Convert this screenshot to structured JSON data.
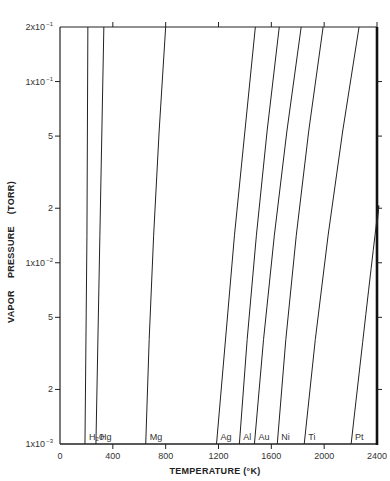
{
  "chart_data": {
    "type": "line",
    "title": "",
    "xlabel": "TEMPERATURE (°K)",
    "ylabel_parts": [
      "VAPOR",
      "PRESSURE",
      "(TORR)"
    ],
    "xlim": [
      0,
      2400
    ],
    "ylim": [
      0.001,
      0.2
    ],
    "yscale": "log",
    "grid": false,
    "legend": "labels at bottom of each curve",
    "x_ticks": [
      {
        "value": 0,
        "label": "0"
      },
      {
        "value": 400,
        "label": "400"
      },
      {
        "value": 800,
        "label": "800"
      },
      {
        "value": 1200,
        "label": "1200"
      },
      {
        "value": 1600,
        "label": "1600"
      },
      {
        "value": 2000,
        "label": "2000"
      },
      {
        "value": 2400,
        "label": "2400"
      }
    ],
    "y_ticks": [
      {
        "value": 0.2,
        "mant": "2x10",
        "exp": "-1"
      },
      {
        "value": 0.1,
        "mant": "1x10",
        "exp": "-1"
      },
      {
        "value": 0.05,
        "mant": "5",
        "exp": ""
      },
      {
        "value": 0.02,
        "mant": "2",
        "exp": ""
      },
      {
        "value": 0.01,
        "mant": "1x10",
        "exp": "-2"
      },
      {
        "value": 0.005,
        "mant": "5",
        "exp": ""
      },
      {
        "value": 0.002,
        "mant": "2",
        "exp": ""
      },
      {
        "value": 0.001,
        "mant": "1x10",
        "exp": "-3"
      }
    ],
    "series": [
      {
        "name": "H2O",
        "label": "H₂0",
        "points": [
          [
            189,
            0.001
          ],
          [
            204,
            0.0142
          ],
          [
            211,
            0.2
          ]
        ]
      },
      {
        "name": "Hg",
        "label": "Hg",
        "points": [
          [
            272,
            0.001
          ],
          [
            302,
            0.0142
          ],
          [
            332,
            0.2
          ]
        ]
      },
      {
        "name": "Mg",
        "label": "Mg",
        "points": [
          [
            649,
            0.001
          ],
          [
            709,
            0.0142
          ],
          [
            800,
            0.2
          ]
        ]
      },
      {
        "name": "Ag",
        "label": "Ag",
        "points": [
          [
            1185,
            0.001
          ],
          [
            1321,
            0.0142
          ],
          [
            1479,
            0.2
          ]
        ]
      },
      {
        "name": "Al",
        "label": "Al",
        "points": [
          [
            1358,
            0.001
          ],
          [
            1487,
            0.0142
          ],
          [
            1660,
            0.2
          ]
        ]
      },
      {
        "name": "Au",
        "label": "Au",
        "points": [
          [
            1472,
            0.001
          ],
          [
            1623,
            0.0142
          ],
          [
            1826,
            0.2
          ]
        ]
      },
      {
        "name": "Ni",
        "label": "Ni",
        "points": [
          [
            1645,
            0.001
          ],
          [
            1789,
            0.0142
          ],
          [
            1992,
            0.2
          ]
        ]
      },
      {
        "name": "Ti",
        "label": "Ti",
        "points": [
          [
            1849,
            0.001
          ],
          [
            2030,
            0.0142
          ],
          [
            2264,
            0.2
          ]
        ]
      },
      {
        "name": "Pt",
        "label": "Pt",
        "points": [
          [
            2204,
            0.001
          ],
          [
            2385,
            0.0142
          ],
          [
            2400,
            0.016
          ]
        ]
      }
    ]
  }
}
